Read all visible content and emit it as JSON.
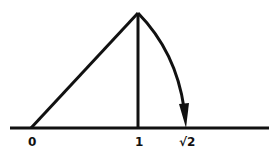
{
  "diagram": {
    "colors": {
      "stroke": "#111111",
      "background": "#ffffff"
    },
    "labels": {
      "zero": "0",
      "one": "1",
      "sqrt2": "√2"
    }
  }
}
